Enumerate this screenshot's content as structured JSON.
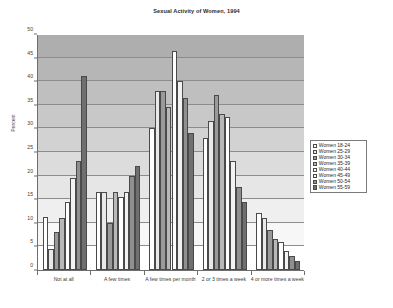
{
  "chart_data": {
    "type": "bar",
    "title": "Sexual Activity of Women, 1994",
    "xlabel": "",
    "ylabel": "Percent",
    "ylim": [
      0,
      50
    ],
    "ytick_step": 5,
    "yticks": [
      "0",
      "5",
      "10",
      "15",
      "20",
      "25",
      "30",
      "35",
      "40",
      "45",
      "50"
    ],
    "grid": true,
    "legend_position": "right",
    "categories": [
      "Not at all",
      "A few times",
      "A few times per month",
      "2 or 3 times a week",
      "4 or more times a week"
    ],
    "series": [
      {
        "name": "Women 18-24",
        "values": [
          11.3,
          16.5,
          30.0,
          28.0,
          12.0
        ]
      },
      {
        "name": "Women 25-29",
        "values": [
          4.5,
          16.5,
          38.0,
          31.5,
          11.0
        ]
      },
      {
        "name": "Women 30-34",
        "values": [
          8.0,
          10.0,
          38.0,
          37.0,
          8.5
        ]
      },
      {
        "name": "Women 35-39",
        "values": [
          11.0,
          16.5,
          34.5,
          33.0,
          6.5
        ]
      },
      {
        "name": "Women 40-44",
        "values": [
          14.5,
          15.5,
          46.5,
          32.5,
          6.0
        ]
      },
      {
        "name": "Women 45-49",
        "values": [
          19.5,
          16.5,
          40.0,
          23.0,
          4.0
        ]
      },
      {
        "name": "Women 50-54",
        "values": [
          23.0,
          20.0,
          36.5,
          17.5,
          3.0
        ]
      },
      {
        "name": "Women 55-59",
        "values": [
          41.0,
          22.0,
          29.0,
          14.5,
          2.0
        ]
      }
    ],
    "series_colors": [
      "#ffffff",
      "#e9e9e9",
      "#9a9a9a",
      "#b8b8b8",
      "#ffffff",
      "#f2f2f2",
      "#8f8f8f",
      "#6f6f6f"
    ],
    "band_colors": [
      "#ffffff",
      "#f7f7f7",
      "#efefef",
      "#e6e6e6",
      "#dcdcdc",
      "#d2d2d2",
      "#c8c8c8",
      "#bfbfbf",
      "#b6b6b6",
      "#aeaeae"
    ]
  }
}
